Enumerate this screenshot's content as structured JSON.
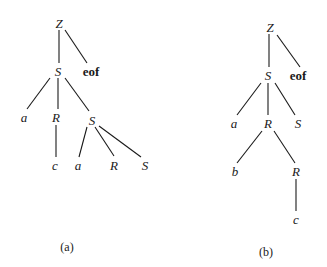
{
  "colors": {
    "ink": "#1a1a1a",
    "background": "#ffffff"
  },
  "trees": [
    {
      "id": "a",
      "caption": "(a)",
      "caption_pos": [
        67,
        247
      ],
      "nodes": [
        {
          "id": "Z",
          "label": "Z",
          "x": 59,
          "y": 23,
          "style": "it"
        },
        {
          "id": "S1",
          "label": "S",
          "x": 58,
          "y": 71,
          "style": "it"
        },
        {
          "id": "eof",
          "label": "eof",
          "x": 91,
          "y": 71,
          "style": "bold"
        },
        {
          "id": "a1",
          "label": "a",
          "x": 24,
          "y": 117,
          "style": "it"
        },
        {
          "id": "R1",
          "label": "R",
          "x": 56,
          "y": 117,
          "style": "it"
        },
        {
          "id": "S2",
          "label": "S",
          "x": 92,
          "y": 120,
          "style": "it"
        },
        {
          "id": "c1",
          "label": "c",
          "x": 55,
          "y": 165,
          "style": "it"
        },
        {
          "id": "a2",
          "label": "a",
          "x": 78,
          "y": 165,
          "style": "it"
        },
        {
          "id": "R2",
          "label": "R",
          "x": 114,
          "y": 165,
          "style": "it"
        },
        {
          "id": "S3",
          "label": "S",
          "x": 145,
          "y": 165,
          "style": "it"
        }
      ],
      "edges": [
        [
          59,
          30,
          59,
          63
        ],
        [
          65,
          30,
          87,
          63
        ],
        [
          50,
          78,
          27,
          109
        ],
        [
          58,
          78,
          58,
          109
        ],
        [
          65,
          78,
          89,
          111
        ],
        [
          56,
          125,
          56,
          157
        ],
        [
          87,
          127,
          79,
          157
        ],
        [
          95,
          127,
          114,
          156
        ],
        [
          99,
          126,
          141,
          157
        ]
      ]
    },
    {
      "id": "b",
      "caption": "(b)",
      "caption_pos": [
        266,
        252
      ],
      "nodes": [
        {
          "id": "Z",
          "label": "Z",
          "x": 270,
          "y": 27,
          "style": "it"
        },
        {
          "id": "S1",
          "label": "S",
          "x": 268,
          "y": 75,
          "style": "it"
        },
        {
          "id": "eof",
          "label": "eof",
          "x": 298,
          "y": 75,
          "style": "bold"
        },
        {
          "id": "a1",
          "label": "a",
          "x": 234,
          "y": 123,
          "style": "it"
        },
        {
          "id": "R1",
          "label": "R",
          "x": 268,
          "y": 123,
          "style": "it"
        },
        {
          "id": "S2",
          "label": "S",
          "x": 298,
          "y": 123,
          "style": "it"
        },
        {
          "id": "b1",
          "label": "b",
          "x": 235,
          "y": 171,
          "style": "it"
        },
        {
          "id": "R2",
          "label": "R",
          "x": 296,
          "y": 171,
          "style": "it"
        },
        {
          "id": "c1",
          "label": "c",
          "x": 296,
          "y": 219,
          "style": "it"
        }
      ],
      "edges": [
        [
          269,
          34,
          269,
          67
        ],
        [
          277,
          35,
          300,
          67
        ],
        [
          261,
          83,
          237,
          115
        ],
        [
          268,
          83,
          268,
          115
        ],
        [
          275,
          83,
          295,
          115
        ],
        [
          262,
          131,
          237,
          163
        ],
        [
          274,
          131,
          295,
          163
        ],
        [
          296,
          179,
          296,
          211
        ]
      ]
    }
  ]
}
